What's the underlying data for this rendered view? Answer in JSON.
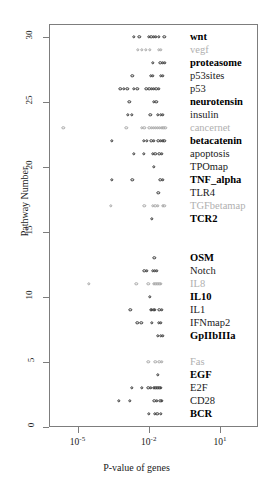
{
  "chart_data": {
    "type": "scatter",
    "title": "",
    "xlabel": "P-value of genes",
    "ylabel": "Pathway Number",
    "xscale": "log",
    "xlim": [
      -6.2,
      2.6
    ],
    "ylim": [
      0,
      31
    ],
    "grid": false,
    "legend": null,
    "xticks": [
      {
        "value": -5,
        "label": "10",
        "exp": "-5"
      },
      {
        "value": -2,
        "label": "10",
        "exp": "-2"
      },
      {
        "value": 1,
        "label": "10",
        "exp": "1"
      }
    ],
    "yticks": [
      0,
      5,
      10,
      15,
      20,
      25,
      30
    ],
    "marker": "open-circle",
    "series": [
      {
        "name": "wnt",
        "pathway": 30,
        "style": "bold",
        "x": [
          -2.62,
          -2.4,
          -2.0,
          -1.9,
          -1.8,
          -1.7,
          -1.58,
          -1.35
        ]
      },
      {
        "name": "vegf",
        "pathway": 29,
        "style": "gray",
        "x": [
          -2.45,
          -2.28,
          -2.12,
          -1.96,
          -1.58,
          -1.48
        ]
      },
      {
        "name": "proteasome",
        "pathway": 28,
        "style": "bold",
        "x": [
          -1.82,
          -1.52,
          -1.4,
          -1.33
        ]
      },
      {
        "name": "p53sites",
        "pathway": 27,
        "style": "normal",
        "x": [
          -2.7,
          -1.92,
          -1.82,
          -1.5,
          -1.4
        ]
      },
      {
        "name": "p53",
        "pathway": 26,
        "style": "normal",
        "x": [
          -3.2,
          -3.05,
          -2.9,
          -2.62,
          -2.48,
          -2.1,
          -1.98,
          -1.88,
          -1.78,
          -1.68,
          -1.58
        ]
      },
      {
        "name": "neurotensin",
        "pathway": 25,
        "style": "bold",
        "x": [
          -2.82,
          -1.78,
          -1.68
        ]
      },
      {
        "name": "insulin",
        "pathway": 24,
        "style": "normal",
        "x": [
          -2.88,
          -2.72,
          -1.94,
          -1.62,
          -1.5,
          -1.42
        ]
      },
      {
        "name": "cancernet",
        "pathway": 23,
        "style": "gray",
        "x": [
          -5.6,
          -2.95,
          -2.3,
          -2.18,
          -1.98,
          -1.88,
          -1.78,
          -1.7,
          -1.62,
          -1.54,
          -1.46,
          -1.38,
          -1.3
        ]
      },
      {
        "name": "betacatenin",
        "pathway": 22,
        "style": "bold",
        "x": [
          -3.55,
          -2.22,
          -2.08,
          -1.9,
          -1.8,
          -1.6,
          -1.5,
          -1.42,
          -1.34
        ]
      },
      {
        "name": "apoptosis",
        "pathway": 21,
        "style": "normal",
        "x": [
          -2.62,
          -2.22,
          -1.82,
          -1.72,
          -1.56,
          -1.46
        ]
      },
      {
        "name": "TPOmap",
        "pathway": 20,
        "style": "normal",
        "x": [
          -1.8
        ]
      },
      {
        "name": "TNF_alpha",
        "pathway": 19,
        "style": "bold",
        "x": [
          -3.55,
          -2.7,
          -1.52,
          -1.42
        ]
      },
      {
        "name": "TLR4",
        "pathway": 18,
        "style": "normal",
        "x": [
          -1.6
        ]
      },
      {
        "name": "TGFbetamap",
        "pathway": 17,
        "style": "gray",
        "x": [
          -3.6,
          -2.18,
          -1.82,
          -1.72,
          -1.62,
          -1.42,
          -1.34
        ]
      },
      {
        "name": "TCR2",
        "pathway": 16,
        "style": "bold",
        "x": [
          -1.86
        ]
      },
      {
        "name": "OSM",
        "pathway": 13,
        "style": "bold",
        "x": [
          -1.76
        ]
      },
      {
        "name": "Notch",
        "pathway": 12,
        "style": "normal",
        "x": [
          -2.18,
          -2.08,
          -1.82,
          -1.74,
          -1.66
        ]
      },
      {
        "name": "IL8",
        "pathway": 11,
        "style": "gray",
        "x": [
          -4.52,
          -2.52,
          -2.02,
          -1.8,
          -1.72,
          -1.64,
          -1.56,
          -1.48
        ]
      },
      {
        "name": "IL10",
        "pathway": 10,
        "style": "bold",
        "x": [
          -1.96
        ]
      },
      {
        "name": "IL1",
        "pathway": 9,
        "style": "normal",
        "x": [
          -2.78,
          -1.92,
          -1.86,
          -1.8,
          -1.74,
          -1.56,
          -1.46
        ]
      },
      {
        "name": "IFNmap2",
        "pathway": 8,
        "style": "normal",
        "x": [
          -2.48,
          -2.32,
          -1.86,
          -1.58,
          -1.48
        ]
      },
      {
        "name": "GpIIbIIIa",
        "pathway": 7,
        "style": "bold",
        "x": [
          -1.62,
          -1.5,
          -1.42
        ]
      },
      {
        "name": "Fas",
        "pathway": 5,
        "style": "gray",
        "x": [
          -2.02,
          -1.72,
          -1.56,
          -1.46
        ]
      },
      {
        "name": "EGF",
        "pathway": 4,
        "style": "bold",
        "x": [
          -1.62
        ]
      },
      {
        "name": "E2F",
        "pathway": 3,
        "style": "normal",
        "x": [
          -2.72,
          -2.3,
          -2.02,
          -1.92,
          -1.8,
          -1.72,
          -1.64,
          -1.56,
          -1.48
        ]
      },
      {
        "name": "CD28",
        "pathway": 2,
        "style": "normal",
        "x": [
          -3.25,
          -2.8,
          -1.76,
          -1.66,
          -1.52,
          -1.44
        ]
      },
      {
        "name": "BCR",
        "pathway": 1,
        "style": "bold",
        "x": [
          -2.0,
          -1.74,
          -1.64,
          -1.48
        ]
      }
    ]
  }
}
